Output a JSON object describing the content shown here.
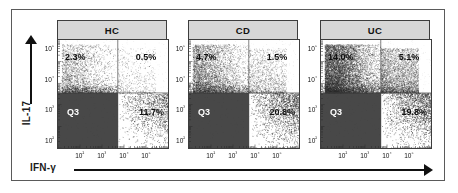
{
  "figure": {
    "type": "flow-cytometry-dot-plots",
    "axes": {
      "x": {
        "label": "IFN-γ",
        "ticks": [
          "10²",
          "10³",
          "10⁴",
          "10⁵"
        ],
        "scale": "log",
        "arrow": true
      },
      "y": {
        "label": "IL-17",
        "ticks": [
          "10⁵",
          "10⁴",
          "10³",
          "10²"
        ],
        "scale": "log",
        "arrow": true
      }
    },
    "colors": {
      "header_fill": "#d6d6d6",
      "border": "#3d3d3d",
      "frame": "#5a5a5a",
      "dot": "#2b2b2b",
      "dense_fill": "#3a3a3a",
      "text": "#111111",
      "inverse_text": "#ffffff"
    }
  },
  "chart_data": {
    "type": "scatter",
    "title": "",
    "xlabel": "IFN-γ",
    "ylabel": "IL-17",
    "xlim": [
      10,
      1000000
    ],
    "ylim": [
      10,
      1000000
    ],
    "xticks": [
      "10²",
      "10³",
      "10⁴",
      "10⁵"
    ],
    "yticks": [
      "10⁵",
      "10⁴",
      "10³",
      "10²"
    ],
    "grid": false,
    "legend": "none",
    "quadrant_gate": {
      "x_divider_decade": 2.72,
      "y_divider_decade": 2.55
    },
    "panels": [
      {
        "name": "HC",
        "title": "HC",
        "quadrants": {
          "upper_left": "2.3%",
          "upper_right": "0.5%",
          "lower_left": "Q3",
          "lower_right": "11.7%"
        },
        "values": {
          "upper_left": 2.3,
          "upper_right": 0.5,
          "lower_right": 11.7
        },
        "density": {
          "points": 5200,
          "ul_frac": 0.055,
          "ur_frac": 0.012,
          "ll_frac": 0.7,
          "lr_frac": 0.233,
          "spread": 0.62,
          "seed": 11
        }
      },
      {
        "name": "CD",
        "title": "CD",
        "quadrants": {
          "upper_left": "4.7%",
          "upper_right": "1.5%",
          "lower_left": "Q3",
          "lower_right": "20.8%"
        },
        "values": {
          "upper_left": 4.7,
          "upper_right": 1.5,
          "lower_right": 20.8
        },
        "density": {
          "points": 5600,
          "ul_frac": 0.1,
          "ur_frac": 0.032,
          "ll_frac": 0.56,
          "lr_frac": 0.308,
          "spread": 0.7,
          "seed": 27
        }
      },
      {
        "name": "UC",
        "title": "UC",
        "quadrants": {
          "upper_left": "14.0%",
          "upper_right": "5.1%",
          "lower_left": "Q3",
          "lower_right": "19.8%"
        },
        "values": {
          "upper_left": 14.0,
          "upper_right": 5.1,
          "lower_right": 19.8
        },
        "density": {
          "points": 6400,
          "ul_frac": 0.2,
          "ur_frac": 0.085,
          "ll_frac": 0.44,
          "lr_frac": 0.275,
          "spread": 0.8,
          "seed": 43
        }
      }
    ]
  }
}
